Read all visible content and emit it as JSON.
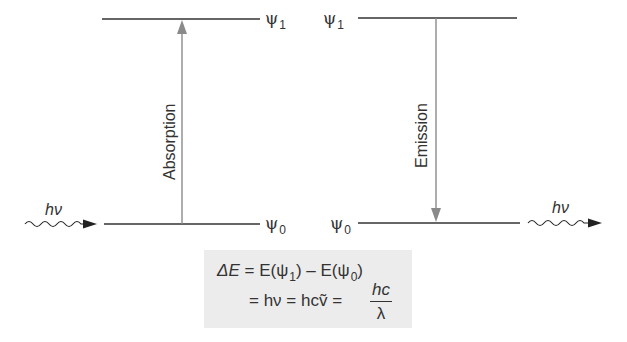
{
  "diagram": {
    "type": "energy-level-transition",
    "levels": {
      "upper_label": "ψ",
      "upper_sub": "1",
      "lower_label": "ψ",
      "lower_sub": "0"
    },
    "transitions": [
      {
        "name": "Absorption",
        "label": "Absorption",
        "direction": "up"
      },
      {
        "name": "Emission",
        "label": "Emission",
        "direction": "down"
      }
    ],
    "photon_in": {
      "label": "hν"
    },
    "photon_out": {
      "label": "hν"
    },
    "equation": {
      "line1_lhs": "ΔE",
      "line1_rhs_a": "= E(ψ",
      "line1_rhs_sub1": "1",
      "line1_rhs_b": ") – E(ψ",
      "line1_rhs_sub0": "0",
      "line1_rhs_c": ")",
      "line2_a": "= hν = hc",
      "line2_nu_tilde": "ṽ",
      "line2_eq": " = ",
      "frac_num": "hc",
      "frac_den": "λ"
    },
    "colors": {
      "line": "#333333",
      "arrow": "#8a8a8a",
      "equation_bg": "#ececec"
    }
  }
}
